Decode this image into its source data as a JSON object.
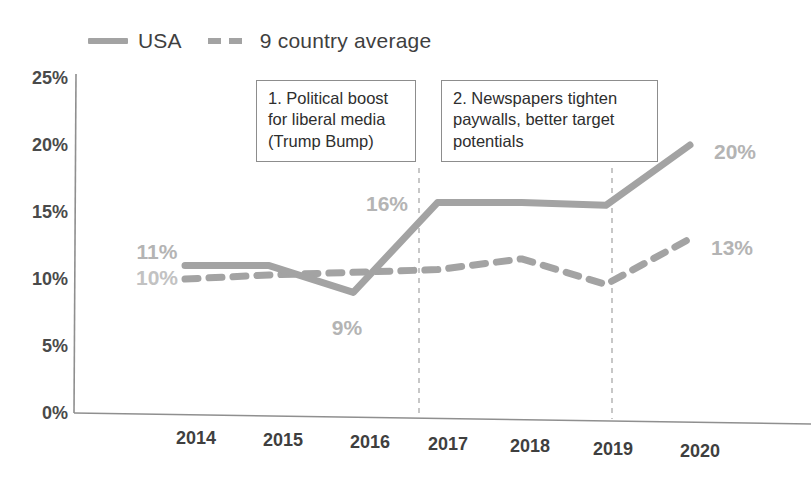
{
  "chart_data": {
    "type": "line",
    "title": "",
    "subtitle": "",
    "xlabel": "",
    "ylabel": "",
    "categories": [
      "2014",
      "2015",
      "2016",
      "2017",
      "2018",
      "2019",
      "2020"
    ],
    "ylim": [
      0,
      25
    ],
    "ytick_labels": [
      "0%",
      "5%",
      "10%",
      "15%",
      "20%",
      "25%"
    ],
    "ytick_values": [
      0,
      5,
      10,
      15,
      20,
      25
    ],
    "grid": false,
    "legend_position": "top-left",
    "series": [
      {
        "name": "USA",
        "style": "solid",
        "color": "#a3a3a3",
        "values": [
          11,
          11,
          9,
          15.7,
          15.7,
          15.5,
          20
        ]
      },
      {
        "name": "9 country average",
        "style": "dashed",
        "color": "#a3a3a3",
        "values": [
          10,
          10.3,
          10.5,
          10.7,
          11.5,
          9.6,
          13
        ]
      }
    ],
    "data_labels": [
      {
        "text": "11%",
        "series": "USA",
        "category": "2014",
        "value": 11
      },
      {
        "text": "10%",
        "series": "9 country average",
        "category": "2014",
        "value": 10
      },
      {
        "text": "9%",
        "series": "USA",
        "category": "2016",
        "value": 9
      },
      {
        "text": "16%",
        "series": "USA",
        "category": "2017",
        "value": 15.7
      },
      {
        "text": "20%",
        "series": "USA",
        "category": "2020",
        "value": 20
      },
      {
        "text": "13%",
        "series": "9 country average",
        "category": "2020",
        "value": 13
      }
    ],
    "annotations": [
      {
        "id": 1,
        "lines": [
          "1. Political boost",
          "for liberal media",
          "(Trump Bump)"
        ],
        "marker_category": "2017"
      },
      {
        "id": 2,
        "lines": [
          "2. Newspapers tighten",
          "paywalls, better target",
          "potentials"
        ],
        "marker_category": "2019"
      }
    ],
    "vertical_markers": [
      "2017",
      "2019"
    ]
  },
  "legend": {
    "items": [
      {
        "label": "USA",
        "style": "solid"
      },
      {
        "label": "9 country average",
        "style": "dashed"
      }
    ]
  },
  "colors": {
    "line": "#a3a3a3",
    "axis": "#8a8a8a",
    "label_text": "#4a4a4a",
    "point_label": "#b4b4b4",
    "annotation_border": "#8d8d8d"
  }
}
